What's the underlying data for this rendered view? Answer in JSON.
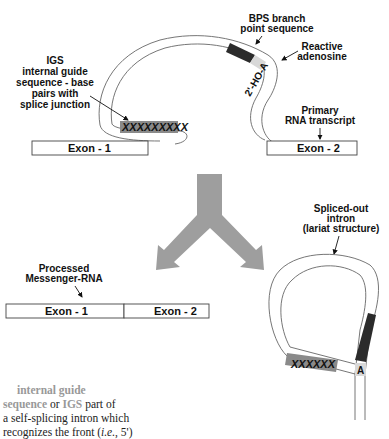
{
  "labels": {
    "igs": [
      "IGS",
      "internal guide",
      "sequence - base",
      "pairs with",
      "splice junction"
    ],
    "bps": [
      "BPS branch",
      "point sequence"
    ],
    "reactive": [
      "Reactive",
      "adenosine"
    ],
    "hoa": "2'-HO-A",
    "primary": [
      "Primary",
      "RNA transcript"
    ],
    "exon1": "Exon - 1",
    "exon2": "Exon - 2",
    "igs_marks": "XXXXXXXXX",
    "processed": [
      "Processed",
      "Messenger-RNA"
    ],
    "lariat": [
      "Spliced-out",
      "intron",
      "(lariat structure)"
    ],
    "lariat_marks": "XXXXXX",
    "lariat_a": "A"
  },
  "definition": {
    "term1": "internal  guide",
    "term2": "sequence",
    "or": " or ",
    "term3": "IGS",
    "rest1": "   part of",
    "line3": "a self-splicing intron which",
    "line4a": "recognizes the front (",
    "line4_it": "i.e.",
    "line4b": ", 5')"
  },
  "colors": {
    "stroke": "#555555",
    "dark_block": "#2b2b2b",
    "igs_block": "#8a8a8a",
    "arrow_fill": "#9e9e9e",
    "a_block": "#d8d8d8"
  }
}
